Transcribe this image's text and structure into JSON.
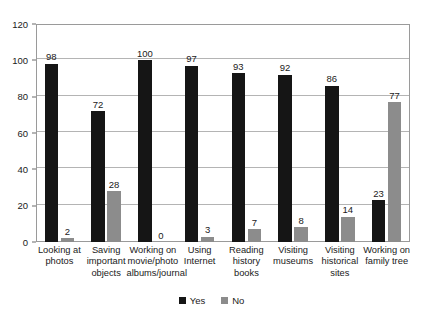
{
  "chart_data": {
    "type": "bar",
    "title": "",
    "subtitle": "",
    "xlabel": "",
    "ylabel": "",
    "ylim": [
      0,
      120
    ],
    "ytick_step": 20,
    "yticks": [
      0,
      20,
      40,
      60,
      80,
      100,
      120
    ],
    "ytick_labels": [
      "0",
      "20",
      "40",
      "60",
      "80",
      "100",
      "120"
    ],
    "grid": true,
    "grid_axis": "y",
    "legend_position": "bottom-center",
    "categories": [
      "Looking at photos",
      "Saving important objects",
      "Working on movie/photo albums/journal",
      "Using Internet",
      "Reading history books",
      "Visiting museums",
      "Visiting historical sites",
      "Working on family tree"
    ],
    "series": [
      {
        "name": "Yes",
        "color": "#151515",
        "values": [
          98,
          72,
          100,
          97,
          93,
          92,
          86,
          23
        ],
        "value_labels": [
          "98",
          "72",
          "100",
          "97",
          "93",
          "92",
          "86",
          "23"
        ]
      },
      {
        "name": "No",
        "color": "#8c8c8c",
        "values": [
          2,
          28,
          0,
          3,
          7,
          8,
          14,
          77
        ],
        "value_labels": [
          "2",
          "28",
          "0",
          "3",
          "7",
          "8",
          "14",
          "77"
        ]
      }
    ]
  },
  "legend": {
    "items": [
      {
        "label": "Yes",
        "color": "#151515"
      },
      {
        "label": "No",
        "color": "#8c8c8c"
      }
    ]
  },
  "colors": {
    "yes": "#151515",
    "no": "#8c8c8c",
    "gridline": "#b4b4b4",
    "frame": "#9a9a9a",
    "background": "#ffffff",
    "text": "#1a1a1a"
  }
}
